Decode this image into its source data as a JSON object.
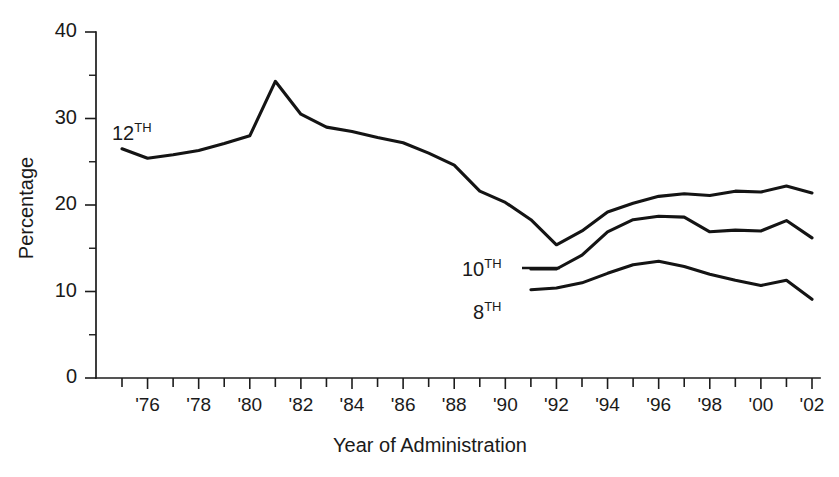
{
  "chart_data": {
    "type": "line",
    "title": "",
    "xlabel": "Year of Administration",
    "ylabel": "Percentage",
    "ylim": [
      0,
      40
    ],
    "yticks": [
      0,
      10,
      20,
      30,
      40
    ],
    "ytick_labels": [
      "0",
      "10",
      "20",
      "30",
      "40"
    ],
    "y_minor_tick_interval": 5,
    "xlim": [
      1975,
      2002
    ],
    "xticks": [
      1975,
      1976,
      1977,
      1978,
      1979,
      1980,
      1981,
      1982,
      1983,
      1984,
      1985,
      1986,
      1987,
      1988,
      1989,
      1990,
      1991,
      1992,
      1993,
      1994,
      1995,
      1996,
      1997,
      1998,
      1999,
      2000,
      2001,
      2002
    ],
    "xtick_labels": [
      "",
      "'76",
      "",
      "'78",
      "",
      "'80",
      "",
      "'82",
      "",
      "'84",
      "",
      "'86",
      "",
      "'88",
      "",
      "'90",
      "",
      "'92",
      "",
      "'94",
      "",
      "'96",
      "",
      "'98",
      "",
      "'00",
      "",
      "'02"
    ],
    "grid": false,
    "legend": "inline-labels",
    "series": [
      {
        "name": "12TH",
        "label_base": "12",
        "label_sup": "TH",
        "x": [
          1975,
          1976,
          1977,
          1978,
          1979,
          1980,
          1981,
          1982,
          1983,
          1984,
          1985,
          1986,
          1987,
          1988,
          1989,
          1990,
          1991,
          1992,
          1993,
          1994,
          1995,
          1996,
          1997,
          1998,
          1999,
          2000,
          2001,
          2002
        ],
        "values": [
          26.5,
          25.4,
          25.8,
          26.3,
          27.1,
          28.0,
          34.3,
          30.5,
          29.0,
          28.5,
          27.8,
          27.2,
          26.0,
          24.6,
          21.6,
          20.3,
          18.3,
          15.4,
          17.0,
          19.2,
          20.2,
          21.0,
          21.3,
          21.1,
          21.6,
          21.5,
          22.2,
          21.4
        ]
      },
      {
        "name": "10TH",
        "label_base": "10",
        "label_sup": "TH",
        "x": [
          1991,
          1992,
          1993,
          1994,
          1995,
          1996,
          1997,
          1998,
          1999,
          2000,
          2001,
          2002
        ],
        "values": [
          12.6,
          12.6,
          14.2,
          16.9,
          18.3,
          18.7,
          18.6,
          16.9,
          17.1,
          17.0,
          18.2,
          16.2
        ]
      },
      {
        "name": "8TH",
        "label_base": "8",
        "label_sup": "TH",
        "x": [
          1991,
          1992,
          1993,
          1994,
          1995,
          1996,
          1997,
          1998,
          1999,
          2000,
          2001,
          2002
        ],
        "values": [
          10.2,
          10.4,
          11.0,
          12.1,
          13.1,
          13.5,
          12.9,
          12.0,
          11.3,
          10.7,
          11.3,
          9.1
        ]
      }
    ],
    "annotations": [
      {
        "name": "label-12th",
        "text_base": "12",
        "text_sup": "TH"
      },
      {
        "name": "label-10th",
        "text_base": "10",
        "text_sup": "TH"
      },
      {
        "name": "label-8th",
        "text_base": "8",
        "text_sup": "TH"
      }
    ],
    "colors": {
      "line": "#141414",
      "axis": "#1c1c1c",
      "background": "#ffffff",
      "text": "#1a1a1a"
    }
  }
}
